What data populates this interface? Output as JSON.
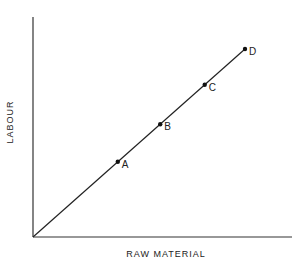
{
  "diagram": {
    "x_axis_label": "RAW MATERIAL",
    "y_axis_label": "LABOUR",
    "line": {
      "description": "Straight line from origin through points A, B, C, D (fixed proportions)",
      "color": "#222222"
    },
    "points": [
      {
        "label": "A",
        "x": 0.4,
        "y": 0.4
      },
      {
        "label": "B",
        "x": 0.6,
        "y": 0.6
      },
      {
        "label": "C",
        "x": 0.81,
        "y": 0.81
      },
      {
        "label": "D",
        "x": 1.0,
        "y": 1.0
      }
    ]
  }
}
